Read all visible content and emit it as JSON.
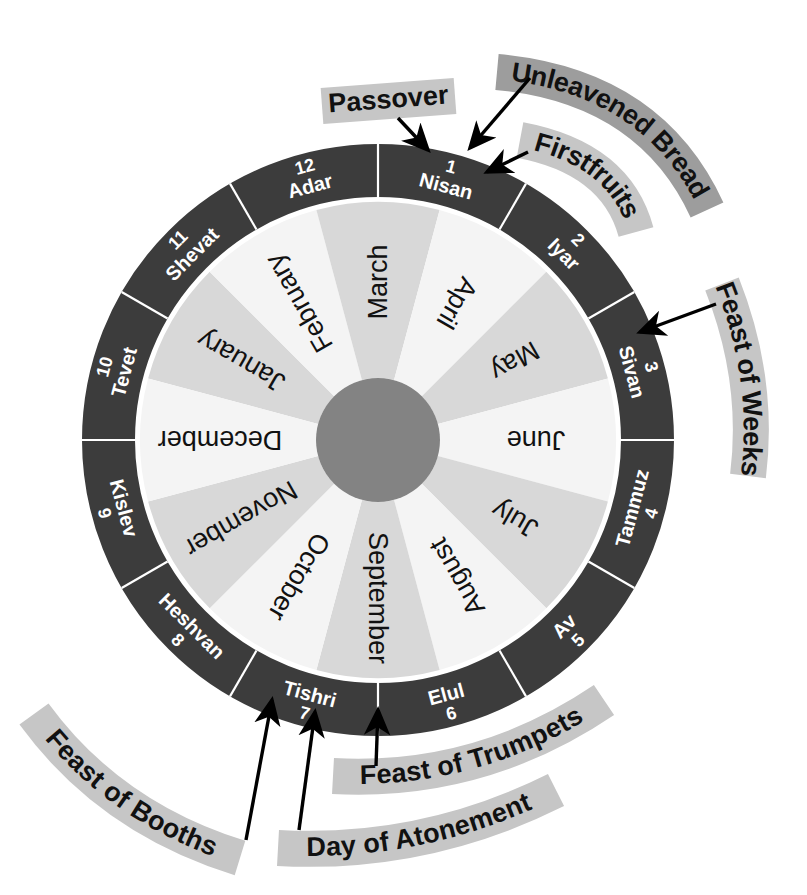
{
  "diagram": {
    "colors": {
      "ring_dark": "#3c3c3c",
      "wedge_light": "#f4f4f4",
      "wedge_mid": "#d8d8d8",
      "hub": "#838383",
      "banner_gray": "#c6c6c6",
      "banner_gray_dark": "#9d9d9d",
      "text_dark": "#111111",
      "text_light": "#ffffff",
      "background": "#ffffff"
    },
    "geometry": {
      "center_x": 378,
      "center_y": 440,
      "outer_radius": 296,
      "ring_inner_radius": 243,
      "wedge_outer_radius": 238,
      "hub_radius": 62
    }
  },
  "gregorian_months": [
    {
      "label": "January",
      "index": 0,
      "shade": "mid"
    },
    {
      "label": "February",
      "index": 1,
      "shade": "light"
    },
    {
      "label": "March",
      "index": 2,
      "shade": "mid"
    },
    {
      "label": "April",
      "index": 3,
      "shade": "light"
    },
    {
      "label": "May",
      "index": 4,
      "shade": "mid"
    },
    {
      "label": "June",
      "index": 5,
      "shade": "light"
    },
    {
      "label": "July",
      "index": 6,
      "shade": "mid"
    },
    {
      "label": "August",
      "index": 7,
      "shade": "light"
    },
    {
      "label": "September",
      "index": 8,
      "shade": "mid"
    },
    {
      "label": "October",
      "index": 9,
      "shade": "light"
    },
    {
      "label": "November",
      "index": 10,
      "shade": "mid"
    },
    {
      "label": "December",
      "index": 11,
      "shade": "light"
    }
  ],
  "hebrew_months": [
    {
      "name": "Nisan",
      "number": "1",
      "index": 0
    },
    {
      "name": "Iyar",
      "number": "2",
      "index": 1
    },
    {
      "name": "Sivan",
      "number": "3",
      "index": 2
    },
    {
      "name": "Tammuz",
      "number": "4",
      "index": 3
    },
    {
      "name": "Av",
      "number": "5",
      "index": 4
    },
    {
      "name": "Elul",
      "number": "6",
      "index": 5
    },
    {
      "name": "Tishri",
      "number": "7",
      "index": 6
    },
    {
      "name": "Heshvan",
      "number": "8",
      "index": 7
    },
    {
      "name": "Kislev",
      "number": "9",
      "index": 8
    },
    {
      "name": "Tevet",
      "number": "10",
      "index": 9
    },
    {
      "name": "Shevat",
      "number": "11",
      "index": 10
    },
    {
      "name": "Adar",
      "number": "12",
      "index": 11
    }
  ],
  "annotations": [
    {
      "id": "passover",
      "label": "Passover",
      "points_to": "Nisan"
    },
    {
      "id": "unleavened-bread",
      "label": "Unleavened Bread",
      "points_to": "Nisan"
    },
    {
      "id": "firstfruits",
      "label": "Firstfruits",
      "points_to": "Nisan"
    },
    {
      "id": "feast-of-weeks",
      "label": "Feast of Weeks",
      "points_to": "Sivan"
    },
    {
      "id": "feast-of-trumpets",
      "label": "Feast of Trumpets",
      "points_to": "Tishri"
    },
    {
      "id": "day-of-atonement",
      "label": "Day of Atonement",
      "points_to": "Tishri"
    },
    {
      "id": "feast-of-booths",
      "label": "Feast of Booths",
      "points_to": "Tishri"
    }
  ]
}
